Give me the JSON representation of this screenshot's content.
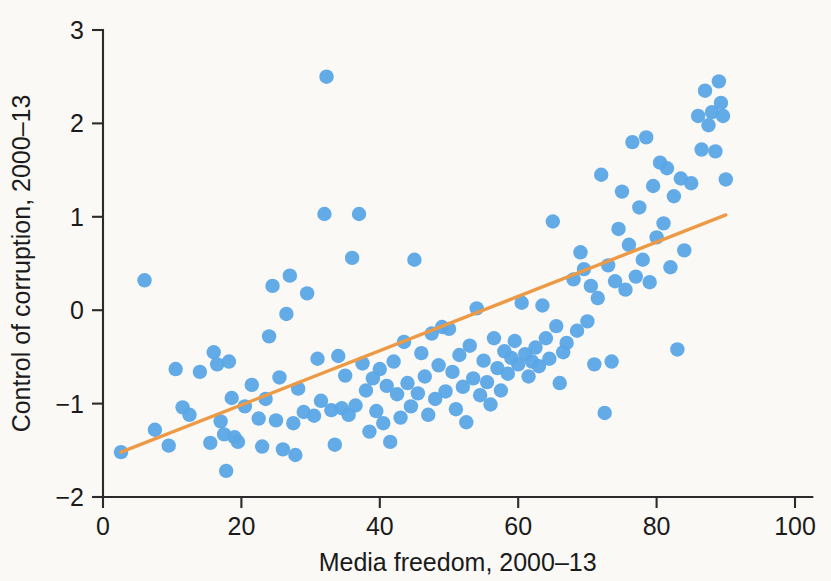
{
  "chart_data": {
    "type": "scatter",
    "title": "",
    "subtitle": "",
    "xlabel": "Media freedom, 2000–13",
    "ylabel": "Control of corruption, 2000–13",
    "xlim": [
      0,
      103
    ],
    "ylim": [
      -2.25,
      3.2
    ],
    "xticks": [
      0,
      20,
      40,
      60,
      80,
      100
    ],
    "xticklabels": [
      "0",
      "20",
      "40",
      "60",
      "80",
      "100"
    ],
    "yticks": [
      -2,
      -1,
      0,
      1,
      2,
      3
    ],
    "yticklabels": [
      "−2",
      "−1",
      "0",
      "1",
      "2",
      "3"
    ],
    "grid": false,
    "legend": null,
    "background_color": "#faf9f6",
    "marker_color": "#5ba7e6",
    "marker_radius": 7.2,
    "marker_opacity": 0.95,
    "line_color": "#ed9a46",
    "line_width": 3.4,
    "series": [
      {
        "name": "Countries",
        "type": "scatter",
        "points": [
          [
            2.6,
            -1.52
          ],
          [
            6.0,
            0.32
          ],
          [
            7.5,
            -1.28
          ],
          [
            9.5,
            -1.45
          ],
          [
            10.5,
            -0.63
          ],
          [
            11.5,
            -1.04
          ],
          [
            12.5,
            -1.12
          ],
          [
            14.0,
            -0.66
          ],
          [
            15.5,
            -1.42
          ],
          [
            16.0,
            -0.45
          ],
          [
            16.5,
            -0.58
          ],
          [
            17.0,
            -1.19
          ],
          [
            17.5,
            -1.33
          ],
          [
            17.8,
            -1.72
          ],
          [
            18.2,
            -0.55
          ],
          [
            18.6,
            -0.94
          ],
          [
            19.0,
            -1.36
          ],
          [
            19.5,
            -1.41
          ],
          [
            20.5,
            -1.03
          ],
          [
            21.5,
            -0.8
          ],
          [
            22.5,
            -1.16
          ],
          [
            23.0,
            -1.46
          ],
          [
            23.5,
            -0.95
          ],
          [
            24.0,
            -0.28
          ],
          [
            24.5,
            0.26
          ],
          [
            25.0,
            -1.18
          ],
          [
            25.5,
            -0.72
          ],
          [
            26.0,
            -1.49
          ],
          [
            26.5,
            -0.04
          ],
          [
            27.0,
            0.37
          ],
          [
            27.5,
            -1.21
          ],
          [
            27.8,
            -1.55
          ],
          [
            28.2,
            -0.84
          ],
          [
            29.0,
            -1.09
          ],
          [
            29.5,
            0.18
          ],
          [
            30.5,
            -1.13
          ],
          [
            31.0,
            -0.52
          ],
          [
            31.5,
            -0.97
          ],
          [
            32.0,
            1.03
          ],
          [
            32.3,
            2.5
          ],
          [
            33.0,
            -1.07
          ],
          [
            33.5,
            -1.44
          ],
          [
            34.0,
            -0.49
          ],
          [
            34.5,
            -1.05
          ],
          [
            35.0,
            -0.7
          ],
          [
            35.5,
            -1.12
          ],
          [
            36.0,
            0.56
          ],
          [
            36.5,
            -1.02
          ],
          [
            37.0,
            1.03
          ],
          [
            37.5,
            -0.57
          ],
          [
            38.0,
            -0.86
          ],
          [
            38.5,
            -1.3
          ],
          [
            39.0,
            -0.73
          ],
          [
            39.5,
            -1.08
          ],
          [
            40.0,
            -0.63
          ],
          [
            40.5,
            -1.21
          ],
          [
            41.0,
            -0.81
          ],
          [
            41.5,
            -1.41
          ],
          [
            42.0,
            -0.55
          ],
          [
            42.5,
            -0.9
          ],
          [
            43.0,
            -1.15
          ],
          [
            43.5,
            -0.34
          ],
          [
            44.0,
            -0.78
          ],
          [
            44.5,
            -1.03
          ],
          [
            45.0,
            0.54
          ],
          [
            45.5,
            -0.89
          ],
          [
            46.0,
            -0.46
          ],
          [
            46.5,
            -0.71
          ],
          [
            47.0,
            -1.12
          ],
          [
            47.5,
            -0.25
          ],
          [
            48.0,
            -0.95
          ],
          [
            48.5,
            -0.59
          ],
          [
            49.0,
            -0.18
          ],
          [
            49.5,
            -0.87
          ],
          [
            50.0,
            -0.2
          ],
          [
            50.5,
            -0.66
          ],
          [
            51.0,
            -1.06
          ],
          [
            51.5,
            -0.48
          ],
          [
            52.0,
            -0.82
          ],
          [
            52.5,
            -1.2
          ],
          [
            53.0,
            -0.38
          ],
          [
            53.5,
            -0.73
          ],
          [
            54.0,
            0.02
          ],
          [
            54.5,
            -0.91
          ],
          [
            55.0,
            -0.54
          ],
          [
            55.5,
            -0.77
          ],
          [
            56.0,
            -1.01
          ],
          [
            56.5,
            -0.3
          ],
          [
            57.0,
            -0.62
          ],
          [
            57.5,
            -0.86
          ],
          [
            58.0,
            -0.44
          ],
          [
            58.5,
            -0.68
          ],
          [
            59.0,
            -0.51
          ],
          [
            59.5,
            -0.33
          ],
          [
            60.0,
            -0.58
          ],
          [
            60.5,
            0.08
          ],
          [
            61.0,
            -0.47
          ],
          [
            61.5,
            -0.71
          ],
          [
            62.0,
            -0.55
          ],
          [
            62.5,
            -0.4
          ],
          [
            63.0,
            -0.6
          ],
          [
            63.5,
            0.05
          ],
          [
            64.0,
            -0.3
          ],
          [
            64.5,
            -0.52
          ],
          [
            65.0,
            0.95
          ],
          [
            65.5,
            -0.17
          ],
          [
            66.0,
            -0.78
          ],
          [
            66.5,
            -0.45
          ],
          [
            67.0,
            -0.35
          ],
          [
            68.0,
            0.33
          ],
          [
            68.5,
            -0.22
          ],
          [
            69.0,
            0.62
          ],
          [
            69.5,
            0.44
          ],
          [
            70.0,
            -0.12
          ],
          [
            70.5,
            0.26
          ],
          [
            71.0,
            -0.58
          ],
          [
            71.5,
            0.13
          ],
          [
            72.0,
            1.45
          ],
          [
            72.5,
            -1.1
          ],
          [
            73.0,
            0.48
          ],
          [
            73.5,
            -0.55
          ],
          [
            74.0,
            0.31
          ],
          [
            74.5,
            0.87
          ],
          [
            75.0,
            1.27
          ],
          [
            75.5,
            0.22
          ],
          [
            76.0,
            0.7
          ],
          [
            76.5,
            1.8
          ],
          [
            77.0,
            0.36
          ],
          [
            77.5,
            1.1
          ],
          [
            78.0,
            0.54
          ],
          [
            78.5,
            1.85
          ],
          [
            79.0,
            0.3
          ],
          [
            79.5,
            1.33
          ],
          [
            80.0,
            0.78
          ],
          [
            80.5,
            1.58
          ],
          [
            81.0,
            0.93
          ],
          [
            81.5,
            1.52
          ],
          [
            82.0,
            0.46
          ],
          [
            82.5,
            1.22
          ],
          [
            83.0,
            -0.42
          ],
          [
            83.5,
            1.41
          ],
          [
            84.0,
            0.64
          ],
          [
            85.0,
            1.36
          ],
          [
            86.0,
            2.08
          ],
          [
            86.5,
            1.72
          ],
          [
            87.0,
            2.35
          ],
          [
            87.5,
            1.98
          ],
          [
            88.0,
            2.12
          ],
          [
            88.5,
            1.7
          ],
          [
            89.0,
            2.45
          ],
          [
            89.3,
            2.22
          ],
          [
            89.6,
            2.08
          ],
          [
            90.0,
            1.4
          ]
        ]
      }
    ],
    "fit_line": {
      "name": "Linear fit",
      "type": "line",
      "x": [
        2.6,
        90.0
      ],
      "y": [
        -1.52,
        1.02
      ],
      "color": "#ed9a46"
    }
  }
}
